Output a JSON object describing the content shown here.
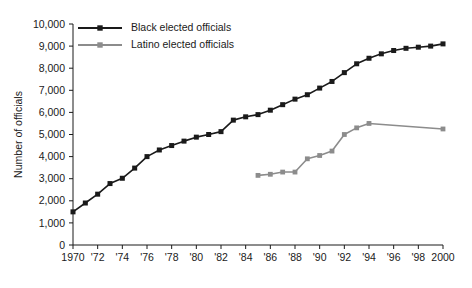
{
  "chart_data": {
    "type": "line",
    "title": "",
    "xlabel": "",
    "ylabel": "Number of officials",
    "xlim": [
      1970,
      2000
    ],
    "ylim": [
      0,
      10000
    ],
    "grid": false,
    "legend_position": "top-left",
    "y_ticks": [
      0,
      1000,
      2000,
      3000,
      4000,
      5000,
      6000,
      7000,
      8000,
      9000,
      10000
    ],
    "y_tick_labels": [
      "0",
      "1,000",
      "2,000",
      "3,000",
      "4,000",
      "5,000",
      "6,000",
      "7,000",
      "8,000",
      "9,000",
      "10,000"
    ],
    "x_ticks": [
      1970,
      1972,
      1974,
      1976,
      1978,
      1980,
      1982,
      1984,
      1986,
      1988,
      1990,
      1992,
      1994,
      1996,
      1998,
      2000
    ],
    "x_tick_labels": [
      "1970",
      "'72",
      "'74",
      "'76",
      "'78",
      "'80",
      "'82",
      "'84",
      "'86",
      "'88",
      "'90",
      "'92",
      "'94",
      "'96",
      "'98",
      "2000"
    ],
    "series": [
      {
        "name": "Black elected officials",
        "color": "#1a1a1a",
        "marker": "square",
        "x": [
          1970,
          1971,
          1972,
          1973,
          1974,
          1975,
          1976,
          1977,
          1978,
          1979,
          1980,
          1981,
          1982,
          1983,
          1984,
          1985,
          1986,
          1987,
          1988,
          1989,
          1990,
          1991,
          1992,
          1993,
          1994,
          1995,
          1996,
          1997,
          1998,
          1999,
          2000
        ],
        "values": [
          1500,
          1900,
          2300,
          2780,
          3020,
          3480,
          4000,
          4300,
          4500,
          4700,
          4880,
          5000,
          5130,
          5650,
          5800,
          5900,
          6100,
          6350,
          6600,
          6800,
          7100,
          7400,
          7800,
          8200,
          8450,
          8650,
          8800,
          8900,
          8950,
          9000,
          9100
        ]
      },
      {
        "name": "Latino elected officials",
        "color": "#8c8c8c",
        "marker": "square",
        "x": [
          1985,
          1986,
          1987,
          1988,
          1989,
          1990,
          1991,
          1992,
          1993,
          1994,
          2000
        ],
        "values": [
          3150,
          3200,
          3300,
          3300,
          3900,
          4050,
          4250,
          5000,
          5300,
          5500,
          5250
        ]
      }
    ]
  },
  "legend": {
    "items": [
      {
        "label": "Black elected officials",
        "color": "#1a1a1a"
      },
      {
        "label": "Latino elected officials",
        "color": "#8c8c8c"
      }
    ]
  },
  "axes": {
    "y_title": "Number of officials"
  }
}
